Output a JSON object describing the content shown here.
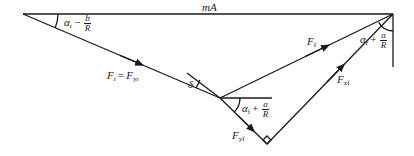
{
  "diagram": {
    "type": "vector-force-diagram",
    "colors": {
      "line": "#1a1a1a",
      "background": "#ffffff"
    },
    "labels": {
      "top": "mA",
      "rear_angle": {
        "alpha": "α",
        "sub": "r",
        "op": "−",
        "num": "b",
        "den": "R"
      },
      "rear_force": {
        "lhs": "F",
        "lhs_sub": "r",
        "eq": "=",
        "rhs": "F",
        "rhs_sub": "yr"
      },
      "delta": "δ",
      "front_angle_lower": {
        "alpha": "α",
        "sub": "f",
        "op": "+",
        "num": "a",
        "den": "R"
      },
      "front_angle_upper": {
        "alpha": "α",
        "sub": "f",
        "op": "+",
        "num": "a",
        "den": "R"
      },
      "front_force": {
        "F": "F",
        "sub": "f"
      },
      "front_lateral": {
        "F": "F",
        "sub": "yf"
      },
      "front_longitudinal": {
        "F": "F",
        "sub": "xf"
      }
    }
  }
}
